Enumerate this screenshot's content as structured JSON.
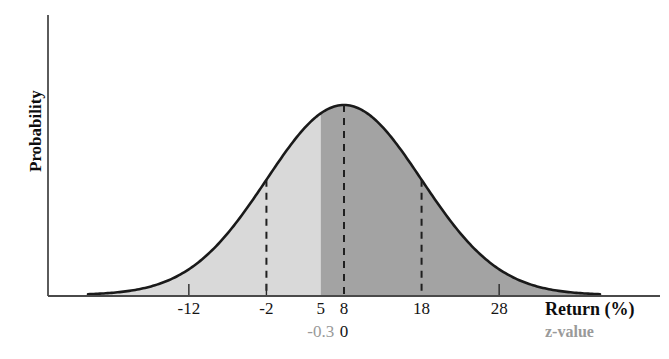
{
  "chart_data": {
    "type": "area",
    "title": "",
    "xlabel": "Return (%)",
    "ylabel": "Probability",
    "secondary_xlabel": "z-value",
    "xlim": [
      -25,
      41
    ],
    "ylim": [
      0,
      1
    ],
    "grid": false,
    "legend": null,
    "distribution": {
      "kind": "normal",
      "mean": 8,
      "std": 10,
      "peak_x": 8
    },
    "x_ticks": [
      {
        "value": -12,
        "label": "-12"
      },
      {
        "value": -2,
        "label": "-2"
      },
      {
        "value": 5,
        "label": "5"
      },
      {
        "value": 8,
        "label": "8"
      },
      {
        "value": 18,
        "label": "18"
      },
      {
        "value": 28,
        "label": "28"
      }
    ],
    "z_ticks": [
      {
        "value": 5,
        "label": "-0.3",
        "color": "#9a9a9a"
      },
      {
        "value": 8,
        "label": "0",
        "color": "#141414"
      }
    ],
    "dashed_lines": [
      -2,
      8,
      18
    ],
    "shaded_regions": [
      {
        "name": "left-region",
        "from": -25,
        "to": 5,
        "color": "#d9d9d9"
      },
      {
        "name": "right-region",
        "from": 5,
        "to": 41,
        "color": "#a3a3a3"
      }
    ],
    "shade_boundary": 5,
    "curve_color": "#1a1a1a",
    "axis_color": "#4a4a4a"
  },
  "axes": {
    "y_title": "Probability",
    "x_title": "Return (%)",
    "z_title": "z-value"
  }
}
